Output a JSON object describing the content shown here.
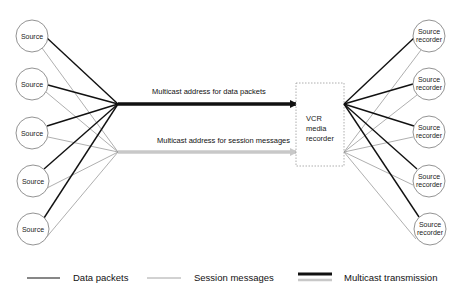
{
  "diagram": {
    "sources": [
      {
        "label": "Source",
        "y": 36
      },
      {
        "label": "Source",
        "y": 84
      },
      {
        "label": "Source",
        "y": 133
      },
      {
        "label": "Source",
        "y": 181
      },
      {
        "label": "Source",
        "y": 229
      }
    ],
    "recorders": [
      {
        "label_line1": "Source",
        "label_line2": "recorder",
        "y": 36
      },
      {
        "label_line1": "Source",
        "label_line2": "recorder",
        "y": 84
      },
      {
        "label_line1": "Source",
        "label_line2": "recorder",
        "y": 132
      },
      {
        "label_line1": "Source",
        "label_line2": "recorder",
        "y": 181
      },
      {
        "label_line1": "Source",
        "label_line2": "recorder",
        "y": 229
      }
    ],
    "vcr": {
      "line1": "VCR",
      "line2": "media",
      "line3": "recorder"
    },
    "data_arrow_label": "Multicast address for data packets",
    "session_arrow_label": "Multicast address for session messages",
    "colors": {
      "data": "#111111",
      "session": "#9a9a9a",
      "session_arrow": "#c8c8c8",
      "circle_stroke": "#777777",
      "box_stroke": "#999999"
    }
  },
  "legend": {
    "data_packets": "Data packets",
    "session_messages": "Session messages",
    "multicast_transmission": "Multicast transmission"
  }
}
